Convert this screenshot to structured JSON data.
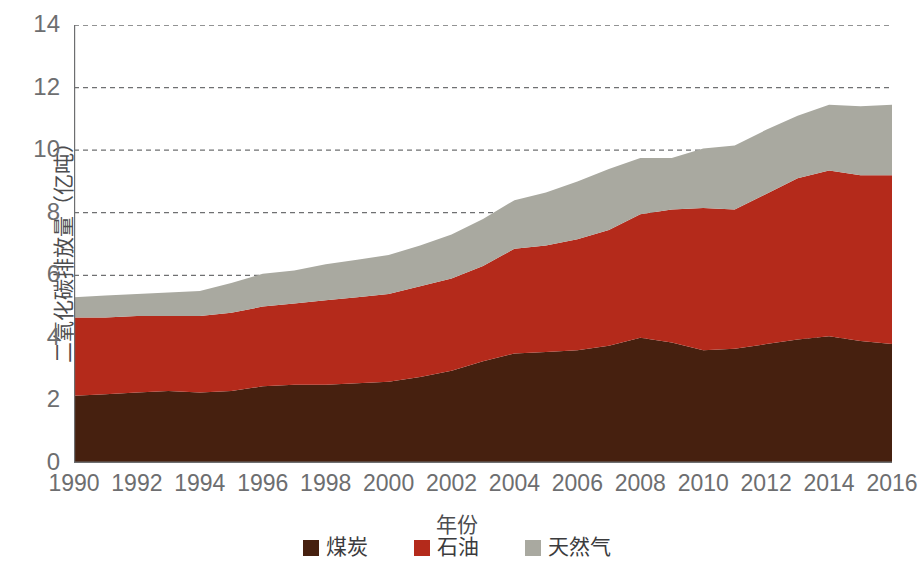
{
  "chart_data": {
    "type": "area",
    "stacked": true,
    "title": "",
    "xlabel": "年份",
    "ylabel": "二氧化碳排放量（亿吨）",
    "x": [
      1990,
      1991,
      1992,
      1993,
      1994,
      1995,
      1996,
      1997,
      1998,
      1999,
      2000,
      2001,
      2002,
      2003,
      2004,
      2005,
      2006,
      2007,
      2008,
      2009,
      2010,
      2011,
      2012,
      2013,
      2014,
      2015,
      2016
    ],
    "xlim": [
      1990,
      2016
    ],
    "ylim": [
      0,
      14
    ],
    "yticks": [
      0,
      2,
      4,
      6,
      8,
      10,
      12,
      14
    ],
    "xticks": [
      1990,
      1992,
      1994,
      1996,
      1998,
      2000,
      2002,
      2004,
      2006,
      2008,
      2010,
      2012,
      2014,
      2016
    ],
    "xtick_labels": [
      "1990",
      "1992",
      "1994",
      "1996",
      "1998",
      "2000",
      "2002",
      "2004",
      "2006",
      "2008",
      "2010",
      "2012",
      "2014",
      "2016"
    ],
    "ytick_labels": [
      "0",
      "2",
      "4",
      "6",
      "8",
      "10",
      "12",
      "14"
    ],
    "grid": "horizontal-dashed",
    "legend_position": "bottom-center",
    "series": [
      {
        "name": "煤炭",
        "color": "#46200f",
        "values": [
          2.15,
          2.2,
          2.25,
          2.3,
          2.25,
          2.3,
          2.45,
          2.5,
          2.5,
          2.55,
          2.6,
          2.75,
          2.95,
          3.25,
          3.5,
          3.55,
          3.6,
          3.75,
          4.0,
          3.85,
          3.6,
          3.65,
          3.8,
          3.95,
          4.05,
          3.9,
          3.8
        ]
      },
      {
        "name": "石油",
        "color": "#b42a1b",
        "values": [
          2.5,
          2.45,
          2.45,
          2.4,
          2.45,
          2.5,
          2.55,
          2.6,
          2.7,
          2.75,
          2.8,
          2.9,
          2.95,
          3.05,
          3.35,
          3.4,
          3.55,
          3.7,
          3.95,
          4.25,
          4.55,
          4.45,
          4.8,
          5.15,
          5.3,
          5.3,
          5.4
        ]
      },
      {
        "name": "天然气",
        "color": "#a9a9a0",
        "values": [
          0.65,
          0.7,
          0.7,
          0.75,
          0.8,
          0.95,
          1.05,
          1.05,
          1.15,
          1.2,
          1.25,
          1.3,
          1.4,
          1.5,
          1.55,
          1.7,
          1.85,
          1.95,
          1.8,
          1.65,
          1.9,
          2.05,
          2.05,
          2.0,
          2.1,
          2.2,
          2.25
        ]
      }
    ],
    "totals": [
      5.3,
      5.35,
      5.4,
      5.45,
      5.5,
      5.75,
      6.05,
      6.15,
      6.35,
      6.5,
      6.65,
      6.95,
      7.3,
      7.8,
      8.4,
      8.65,
      9.0,
      9.4,
      9.75,
      9.75,
      10.05,
      10.15,
      10.65,
      11.1,
      11.45,
      11.4,
      11.45
    ]
  },
  "axes": {
    "y_title": "二氧化碳排放量（亿吨）",
    "x_title": "年份"
  },
  "legend": {
    "items": [
      {
        "label": "煤炭",
        "color": "#46200f"
      },
      {
        "label": "石油",
        "color": "#b42a1b"
      },
      {
        "label": "天然气",
        "color": "#a9a9a0"
      }
    ]
  }
}
